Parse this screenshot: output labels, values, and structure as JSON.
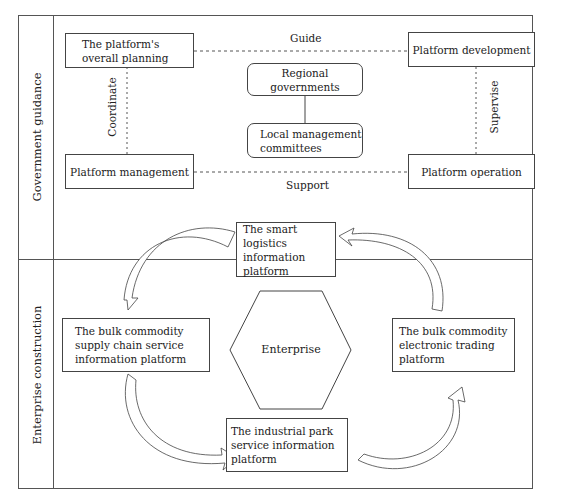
{
  "sections": [
    {
      "id": "government",
      "label": "Government guidance"
    },
    {
      "id": "enterprise",
      "label": "Enterprise construction"
    }
  ],
  "government": {
    "nodes": {
      "overall_planning": "The platform's overall planning",
      "development": "Platform development",
      "management": "Platform management",
      "operation": "Platform operation",
      "regional_governments": "Regional governments",
      "local_committees": "Local management committees"
    },
    "edges": {
      "guide": "Guide",
      "support": "Support",
      "coordinate": "Coordinate",
      "supervise": "Supervise"
    }
  },
  "enterprise": {
    "center": "Enterprise",
    "nodes": {
      "smart_logistics": "The smart logistics information platform",
      "supply_chain": "The bulk commodity supply chain service information platform",
      "trading": "The bulk commodity electronic trading platform",
      "industrial_park": "The industrial park service information platform"
    }
  },
  "colors": {
    "line": "#444444",
    "background": "#ffffff"
  }
}
